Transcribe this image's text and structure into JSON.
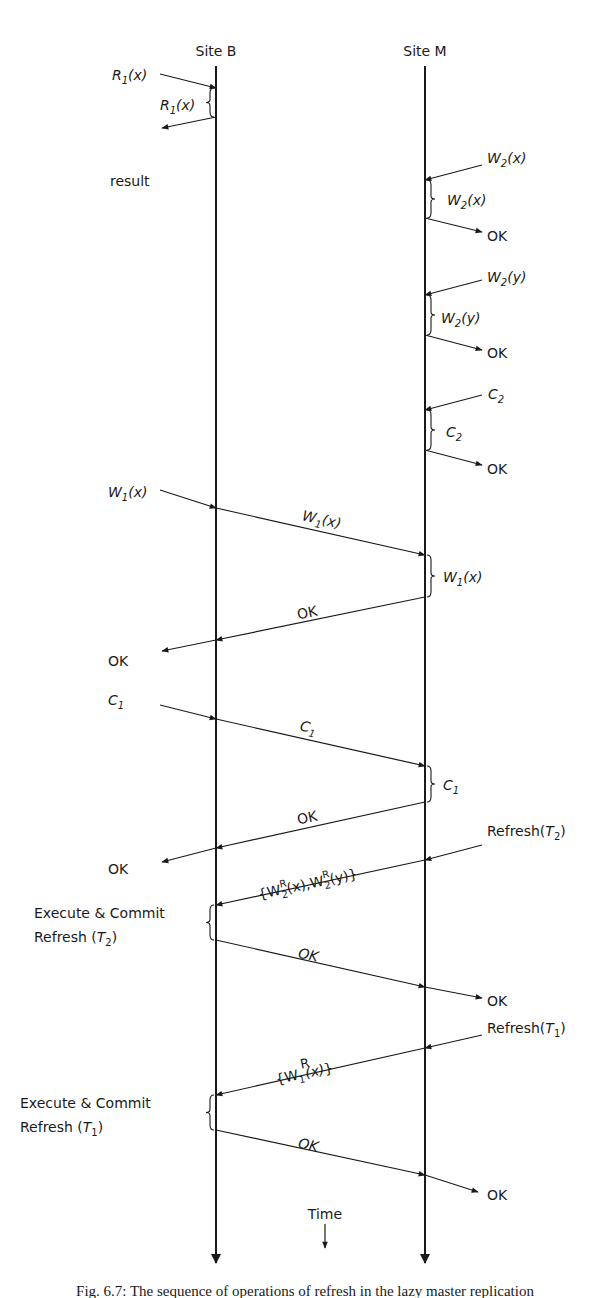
{
  "sites": [
    {
      "name": "Site B",
      "x": 216,
      "label_x": 216,
      "label_y": 56,
      "y_start": 66,
      "y_end": 1263
    },
    {
      "name": "Site M",
      "x": 425,
      "label_x": 425,
      "label_y": 56,
      "y_start": 66,
      "y_end": 1263
    }
  ],
  "time_axis": {
    "label": "Time",
    "x": 325,
    "label_y": 1219,
    "arrow_y1": 1224,
    "arrow_y2": 1248
  },
  "caption": {
    "text": "Fig. 6.7: The sequence of operations of refresh in the lazy master replication",
    "y": 1296
  },
  "messages": [
    {
      "id": "r1-in",
      "points": [
        [
          160,
          74
        ],
        [
          216,
          88
        ]
      ],
      "arrow": "end"
    },
    {
      "id": "r1-result",
      "points": [
        [
          216,
          117
        ],
        [
          162,
          128
        ]
      ],
      "arrow": "end"
    },
    {
      "id": "w2x-in",
      "points": [
        [
          482,
          165
        ],
        [
          425,
          180
        ]
      ],
      "arrow": "end"
    },
    {
      "id": "w2x-ok",
      "points": [
        [
          425,
          218
        ],
        [
          482,
          232
        ]
      ],
      "arrow": "end"
    },
    {
      "id": "w2y-in",
      "points": [
        [
          482,
          280
        ],
        [
          425,
          295
        ]
      ],
      "arrow": "end"
    },
    {
      "id": "w2y-ok",
      "points": [
        [
          425,
          335
        ],
        [
          482,
          350
        ]
      ],
      "arrow": "end"
    },
    {
      "id": "c2-in",
      "points": [
        [
          482,
          395
        ],
        [
          425,
          410
        ]
      ],
      "arrow": "end"
    },
    {
      "id": "c2-ok",
      "points": [
        [
          425,
          450
        ],
        [
          482,
          465
        ]
      ],
      "arrow": "end"
    },
    {
      "id": "w1x-in",
      "points": [
        [
          160,
          490
        ],
        [
          216,
          508
        ]
      ],
      "arrow": "end"
    },
    {
      "id": "w1x-fwd",
      "points": [
        [
          216,
          508
        ],
        [
          425,
          555
        ]
      ],
      "arrow": "end"
    },
    {
      "id": "w1x-ok-back",
      "points": [
        [
          425,
          597
        ],
        [
          216,
          640
        ]
      ],
      "arrow": "end"
    },
    {
      "id": "w1x-ok-out",
      "points": [
        [
          216,
          640
        ],
        [
          162,
          651
        ]
      ],
      "arrow": "end"
    },
    {
      "id": "c1-in",
      "points": [
        [
          160,
          705
        ],
        [
          216,
          719
        ]
      ],
      "arrow": "end"
    },
    {
      "id": "c1-fwd",
      "points": [
        [
          216,
          719
        ],
        [
          425,
          766
        ]
      ],
      "arrow": "end"
    },
    {
      "id": "c1-ok-back",
      "points": [
        [
          425,
          802
        ],
        [
          216,
          848
        ]
      ],
      "arrow": "end"
    },
    {
      "id": "c1-ok-out",
      "points": [
        [
          216,
          848
        ],
        [
          162,
          862
        ]
      ],
      "arrow": "end"
    },
    {
      "id": "refresh-t2-in",
      "points": [
        [
          482,
          845
        ],
        [
          425,
          860
        ]
      ],
      "arrow": "end"
    },
    {
      "id": "refresh-t2-fwd",
      "points": [
        [
          425,
          860
        ],
        [
          216,
          905
        ]
      ],
      "arrow": "end"
    },
    {
      "id": "t2-ok-back",
      "points": [
        [
          216,
          940
        ],
        [
          425,
          987
        ]
      ],
      "arrow": "end"
    },
    {
      "id": "t2-ok-out",
      "points": [
        [
          425,
          987
        ],
        [
          482,
          998
        ]
      ],
      "arrow": "end"
    },
    {
      "id": "refresh-t1-in",
      "points": [
        [
          482,
          1035
        ],
        [
          425,
          1048
        ]
      ],
      "arrow": "end"
    },
    {
      "id": "refresh-t1-fwd",
      "points": [
        [
          425,
          1048
        ],
        [
          216,
          1095
        ]
      ],
      "arrow": "end"
    },
    {
      "id": "t1-ok-back",
      "points": [
        [
          216,
          1130
        ],
        [
          425,
          1175
        ]
      ],
      "arrow": "end"
    },
    {
      "id": "t1-ok-out",
      "points": [
        [
          425,
          1175
        ],
        [
          478,
          1192
        ]
      ],
      "arrow": "end"
    }
  ],
  "braces": [
    {
      "id": "r1-exec",
      "x": 216,
      "y1": 88,
      "y2": 117,
      "side": "left"
    },
    {
      "id": "w2x-exec",
      "x": 425,
      "y1": 180,
      "y2": 218,
      "side": "right"
    },
    {
      "id": "w2y-exec",
      "x": 425,
      "y1": 295,
      "y2": 335,
      "side": "right"
    },
    {
      "id": "c2-exec",
      "x": 425,
      "y1": 410,
      "y2": 450,
      "side": "right"
    },
    {
      "id": "w1x-exec",
      "x": 425,
      "y1": 555,
      "y2": 597,
      "side": "right"
    },
    {
      "id": "c1-exec",
      "x": 425,
      "y1": 766,
      "y2": 802,
      "side": "right"
    },
    {
      "id": "refresh-t2-exec",
      "x": 216,
      "y1": 905,
      "y2": 940,
      "side": "left"
    },
    {
      "id": "refresh-t1-exec",
      "x": 216,
      "y1": 1095,
      "y2": 1130,
      "side": "left"
    }
  ],
  "labels": {
    "r1_in": {
      "main": "R",
      "sub": "1",
      "arg": "(x)"
    },
    "r1_exec": {
      "main": "R",
      "sub": "1",
      "arg": "(x)"
    },
    "result": "result",
    "w2x_in": {
      "main": "W",
      "sub": "2",
      "arg": "(x)"
    },
    "w2x_exec": {
      "main": "W",
      "sub": "2",
      "arg": "(x)"
    },
    "w2x_ok": "OK",
    "w2y_in": {
      "main": "W",
      "sub": "2",
      "arg": "(y)"
    },
    "w2y_exec": {
      "main": "W",
      "sub": "2",
      "arg": "(y)"
    },
    "w2y_ok": "OK",
    "c2_in": {
      "main": "C",
      "sub": "2"
    },
    "c2_exec": {
      "main": "C",
      "sub": "2"
    },
    "c2_ok": "OK",
    "w1x_in": {
      "main": "W",
      "sub": "1",
      "arg": "(x)"
    },
    "w1x_fwd": {
      "main": "W",
      "sub": "1",
      "arg": "(x)"
    },
    "w1x_exec": {
      "main": "W",
      "sub": "1",
      "arg": "(x)"
    },
    "w1x_ok_back": "OK",
    "w1x_ok_out": "OK",
    "c1_in": {
      "main": "C",
      "sub": "1"
    },
    "c1_fwd": {
      "main": "C",
      "sub": "1"
    },
    "c1_exec": {
      "main": "C",
      "sub": "1"
    },
    "c1_ok_back": "OK",
    "c1_ok_out": "OK",
    "refresh_t2": {
      "pre": "Refresh(",
      "main": "T",
      "sub": "2",
      "post": ")"
    },
    "refresh_t2_set": {
      "open": "{",
      "w1": "W",
      "sup1": "R",
      "sub1": "2",
      "arg1": "(x),",
      "w2": "W",
      "sup2": "R",
      "sub2": "2",
      "arg2": "(y)",
      "close": "}"
    },
    "exec_t2_line1": "Execute & Commit",
    "exec_t2_line2": {
      "pre": "Refresh (",
      "main": "T",
      "sub": "2",
      "post": ")"
    },
    "t2_ok_back": "OK",
    "t2_ok_out": "OK",
    "refresh_t1": {
      "pre": "Refresh(",
      "main": "T",
      "sub": "1",
      "post": ")"
    },
    "refresh_t1_set": {
      "open": "{",
      "w": "W",
      "sup": "R",
      "sub": "1",
      "arg": "(x)",
      "close": "}"
    },
    "exec_t1_line1": "Execute & Commit",
    "exec_t1_line2": {
      "pre": "Refresh (",
      "main": "T",
      "sub": "1",
      "post": ")"
    },
    "t1_ok_back": "OK",
    "t1_ok_out": "OK"
  },
  "style": {
    "stroke": "#1a1a1a",
    "background": "#ffffff"
  }
}
